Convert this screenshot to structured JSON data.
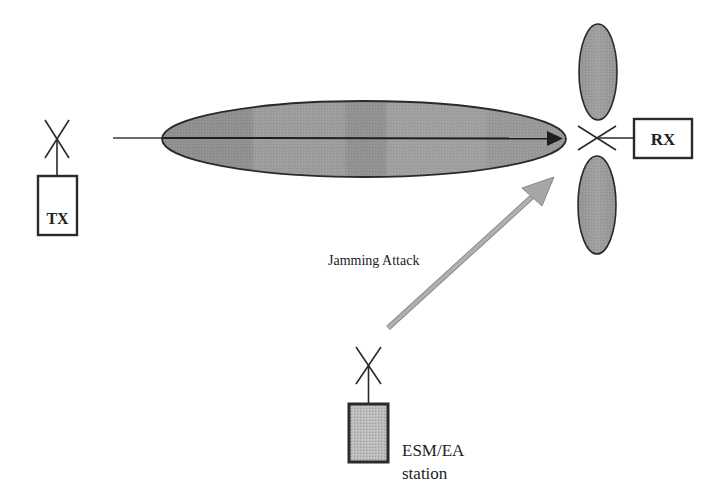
{
  "diagram": {
    "type": "jamming-attack-scenario",
    "colors": {
      "background": "#ffffff",
      "stroke": "#2a2a2a",
      "beam_fill": "#8e8e8e",
      "beam_fill_light": "#a6a6a6",
      "lobe_fill": "#9a9a9a",
      "jamming_arrow": "#a8a8a8",
      "station_fill": "#bdbdbd",
      "text": "#222222"
    },
    "transmitter": {
      "label": "TX"
    },
    "receiver": {
      "label": "RX"
    },
    "main_beam": {
      "description": "Directional main lobe from TX toward RX"
    },
    "side_lobes": {
      "count": 2,
      "description": "Upper and lower side lobes of RX antenna"
    },
    "jamming": {
      "label": "Jamming Attack"
    },
    "jammer": {
      "label_line1": "ESM/EA",
      "label_line2": "station"
    }
  }
}
